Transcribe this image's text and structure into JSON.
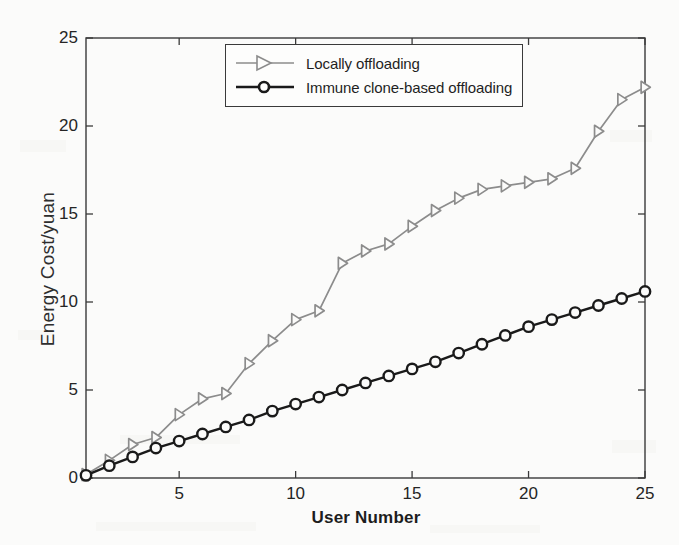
{
  "chart_data": {
    "type": "line",
    "title": "",
    "xlabel": "User Number",
    "ylabel": "Energy Cost/yuan",
    "xlim": [
      1,
      25
    ],
    "ylim": [
      0,
      25
    ],
    "xticks": [
      5,
      10,
      15,
      20,
      25
    ],
    "yticks": [
      0,
      5,
      10,
      15,
      20,
      25
    ],
    "grid": false,
    "legend_position": "top-center",
    "x": [
      1,
      2,
      3,
      4,
      5,
      6,
      7,
      8,
      9,
      10,
      11,
      12,
      13,
      14,
      15,
      16,
      17,
      18,
      19,
      20,
      21,
      22,
      23,
      24,
      25
    ],
    "series": [
      {
        "name": "Locally offloading",
        "color": "#8c8c8c",
        "marker": "triangle-right",
        "values": [
          0.2,
          1.0,
          1.9,
          2.3,
          3.6,
          4.5,
          4.8,
          6.5,
          7.8,
          9.0,
          9.5,
          12.2,
          12.9,
          13.3,
          14.3,
          15.2,
          15.9,
          16.4,
          16.6,
          16.8,
          17.0,
          17.6,
          19.7,
          21.5,
          22.2
        ]
      },
      {
        "name": "Immune clone-based offloading",
        "color": "#1a1a1a",
        "marker": "circle",
        "values": [
          0.15,
          0.7,
          1.2,
          1.7,
          2.1,
          2.5,
          2.9,
          3.3,
          3.8,
          4.2,
          4.6,
          5.0,
          5.4,
          5.8,
          6.2,
          6.6,
          7.1,
          7.6,
          8.1,
          8.6,
          9.0,
          9.4,
          9.8,
          10.2,
          10.6
        ]
      }
    ]
  },
  "legend": {
    "items": [
      {
        "label": "Locally offloading"
      },
      {
        "label": "Immune clone-based offloading"
      }
    ]
  },
  "axes": {
    "x_title": "User Number",
    "y_title": "Energy Cost/yuan",
    "x_tick_labels": [
      "5",
      "10",
      "15",
      "20",
      "25"
    ],
    "y_tick_labels": [
      "0",
      "5",
      "10",
      "15",
      "20",
      "25"
    ]
  },
  "colors": {
    "series_1": "#8c8c8c",
    "series_2": "#1a1a1a",
    "axis": "#3a3a3a",
    "background": "#fbfbfa"
  }
}
